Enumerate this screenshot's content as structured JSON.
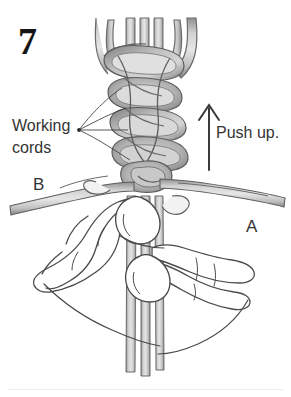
{
  "figure": {
    "step_number": "7",
    "labels": {
      "working_cords_line1": "Working",
      "working_cords_line2": "cords",
      "cord_b": "B",
      "cord_a": "A",
      "push_up": "Push up."
    },
    "icons": {
      "up_arrow": "up-arrow-icon",
      "leader_lines": "leader-line-fan-icon"
    },
    "colors": {
      "background": "#ffffff",
      "text": "#2b2b2b",
      "cord_fill_light": "#d8d8d8",
      "cord_fill_mid": "#bdbdbd",
      "cord_fill_dark": "#9a9a9a",
      "cord_outline": "#5e5e5e",
      "hand_outline": "#4a4a4a",
      "arrow": "#3a3a3a",
      "rule": "#ececec"
    }
  }
}
